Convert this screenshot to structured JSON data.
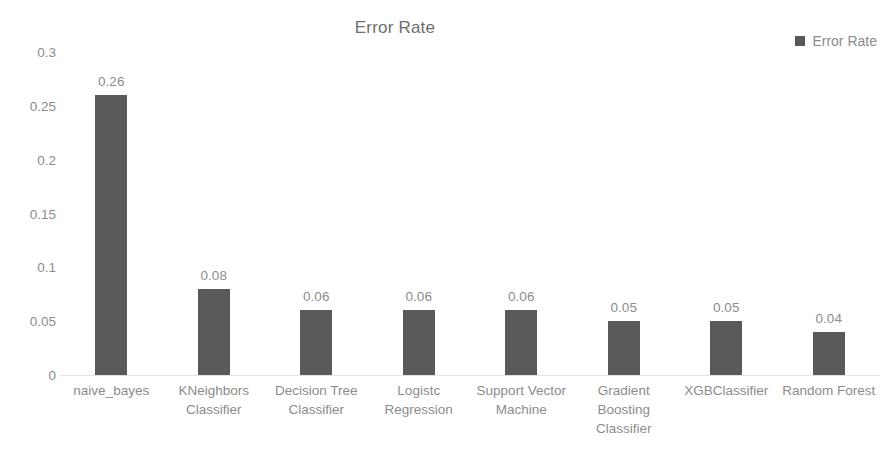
{
  "chart_data": {
    "type": "bar",
    "title": "Error Rate",
    "xlabel": "",
    "ylabel": "",
    "categories": [
      "naive_bayes",
      "KNeighbors Classifier",
      "Decision Tree Classifier",
      "Logistc Regression",
      "Support Vector Machine",
      "Gradient Boosting Classifier",
      "XGBClassifier",
      "Random Forest"
    ],
    "values": [
      0.26,
      0.08,
      0.06,
      0.06,
      0.06,
      0.05,
      0.05,
      0.04
    ],
    "value_labels": [
      "0.26",
      "0.08",
      "0.06",
      "0.06",
      "0.06",
      "0.05",
      "0.05",
      "0.04"
    ],
    "series": [
      {
        "name": "Error Rate",
        "values": [
          0.26,
          0.08,
          0.06,
          0.06,
          0.06,
          0.05,
          0.05,
          0.04
        ]
      }
    ],
    "ylim": [
      0,
      0.3
    ],
    "yticks": [
      0,
      0.05,
      0.1,
      0.15,
      0.2,
      0.25,
      0.3
    ],
    "ytick_labels": [
      "0",
      "0.05",
      "0.1",
      "0.15",
      "0.2",
      "0.25",
      "0.3"
    ],
    "grid": false,
    "legend": {
      "position": "top-right",
      "entries": [
        {
          "label": "Error Rate",
          "color": "#595959"
        }
      ]
    },
    "colors": {
      "bar": "#595959",
      "title_text": "#6e6e6e",
      "axis_text": "#8c8c8c",
      "baseline": "#e3e3e3",
      "background": "#ffffff"
    }
  }
}
